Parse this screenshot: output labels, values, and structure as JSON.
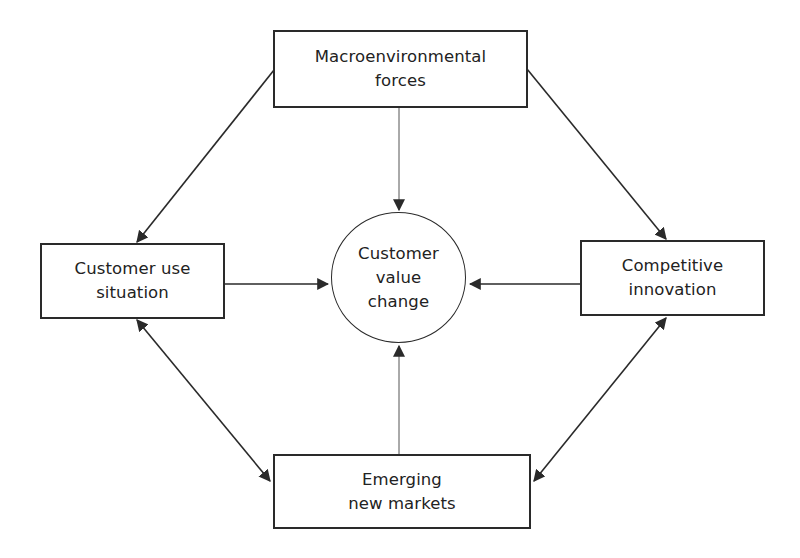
{
  "diagram": {
    "title": "",
    "colors": {
      "stroke": "#2a2a2a",
      "text": "#222222",
      "background": "#ffffff"
    },
    "nodes": {
      "top": {
        "id": "macroenvironmental-forces",
        "label": "Macroenvironmental\nforces",
        "shape": "rectangle"
      },
      "left": {
        "id": "customer-use-situation",
        "label": "Customer use\nsituation",
        "shape": "rectangle"
      },
      "right": {
        "id": "competitive-innovation",
        "label": "Competitive\ninnovation",
        "shape": "rectangle"
      },
      "bottom": {
        "id": "emerging-new-markets",
        "label": "Emerging\nnew markets",
        "shape": "rectangle"
      },
      "center": {
        "id": "customer-value-change",
        "label": "Customer\nvalue\nchange",
        "shape": "circle"
      }
    },
    "edges": [
      {
        "from": "macroenvironmental-forces",
        "to": "customer-use-situation",
        "direction": "one-way"
      },
      {
        "from": "macroenvironmental-forces",
        "to": "competitive-innovation",
        "direction": "one-way"
      },
      {
        "from": "macroenvironmental-forces",
        "to": "customer-value-change",
        "direction": "one-way"
      },
      {
        "from": "customer-use-situation",
        "to": "customer-value-change",
        "direction": "one-way"
      },
      {
        "from": "competitive-innovation",
        "to": "customer-value-change",
        "direction": "one-way"
      },
      {
        "from": "emerging-new-markets",
        "to": "customer-value-change",
        "direction": "one-way"
      },
      {
        "from": "customer-use-situation",
        "to": "emerging-new-markets",
        "direction": "two-way"
      },
      {
        "from": "competitive-innovation",
        "to": "emerging-new-markets",
        "direction": "two-way"
      }
    ]
  }
}
